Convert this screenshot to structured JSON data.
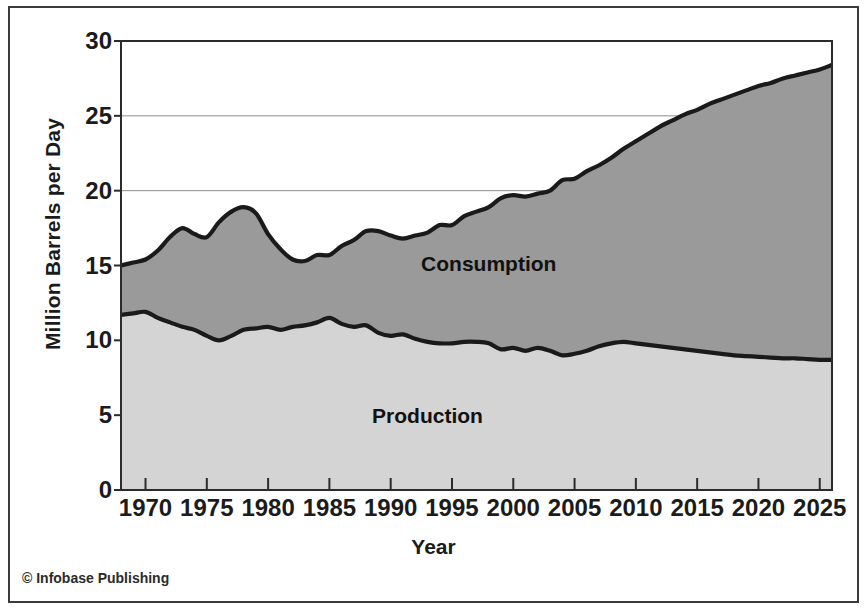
{
  "figure": {
    "credit": "© Infobase Publishing"
  },
  "chart_data": {
    "type": "area",
    "title": "",
    "xlabel": "Year",
    "ylabel": "Million Barrels per Day",
    "xlim": [
      1968,
      2026
    ],
    "ylim": [
      0,
      30
    ],
    "grid": true,
    "grid_axis": "y",
    "legend": "inline-labels",
    "xticks": [
      1970,
      1975,
      1980,
      1985,
      1990,
      1995,
      2000,
      2005,
      2010,
      2015,
      2020,
      2025
    ],
    "yticks": [
      0,
      5,
      10,
      15,
      20,
      25,
      30
    ],
    "colors": {
      "consumption_fill": "#9a9a9a",
      "production_fill": "#d4d4d4",
      "line": "#1a1a1a",
      "frame": "#3a3a3a",
      "text": "#1b1b1b"
    },
    "annotations": [
      {
        "text": "Consumption",
        "x": 1998,
        "y": 14.6
      },
      {
        "text": "Production",
        "x": 1993,
        "y": 4.5
      }
    ],
    "x": [
      1968,
      1969,
      1970,
      1971,
      1972,
      1973,
      1974,
      1975,
      1976,
      1977,
      1978,
      1979,
      1980,
      1981,
      1982,
      1983,
      1984,
      1985,
      1986,
      1987,
      1988,
      1989,
      1990,
      1991,
      1992,
      1993,
      1994,
      1995,
      1996,
      1997,
      1998,
      1999,
      2000,
      2001,
      2002,
      2003,
      2004,
      2005,
      2006,
      2007,
      2008,
      2009,
      2010,
      2011,
      2012,
      2013,
      2014,
      2015,
      2016,
      2017,
      2018,
      2019,
      2020,
      2021,
      2022,
      2023,
      2024,
      2025,
      2026
    ],
    "series": [
      {
        "name": "Consumption",
        "values": [
          15.0,
          15.2,
          15.4,
          16.0,
          16.9,
          17.5,
          17.1,
          16.9,
          17.9,
          18.6,
          18.9,
          18.5,
          17.1,
          16.1,
          15.4,
          15.3,
          15.7,
          15.7,
          16.3,
          16.7,
          17.3,
          17.3,
          17.0,
          16.8,
          17.0,
          17.2,
          17.7,
          17.7,
          18.3,
          18.6,
          18.9,
          19.5,
          19.7,
          19.6,
          19.8,
          20.0,
          20.7,
          20.8,
          21.3,
          21.7,
          22.2,
          22.8,
          23.3,
          23.8,
          24.3,
          24.7,
          25.1,
          25.4,
          25.8,
          26.1,
          26.4,
          26.7,
          27.0,
          27.2,
          27.5,
          27.7,
          27.9,
          28.1,
          28.4
        ]
      },
      {
        "name": "Production",
        "values": [
          11.7,
          11.8,
          11.9,
          11.5,
          11.2,
          10.9,
          10.7,
          10.3,
          10.0,
          10.3,
          10.7,
          10.8,
          10.9,
          10.7,
          10.9,
          11.0,
          11.2,
          11.5,
          11.1,
          10.9,
          11.0,
          10.5,
          10.3,
          10.4,
          10.1,
          9.9,
          9.8,
          9.8,
          9.9,
          9.9,
          9.8,
          9.4,
          9.5,
          9.3,
          9.5,
          9.3,
          9.0,
          9.1,
          9.3,
          9.6,
          9.8,
          9.9,
          9.8,
          9.7,
          9.6,
          9.5,
          9.4,
          9.3,
          9.2,
          9.1,
          9.0,
          8.95,
          8.9,
          8.85,
          8.8,
          8.8,
          8.75,
          8.7,
          8.7
        ]
      }
    ]
  }
}
